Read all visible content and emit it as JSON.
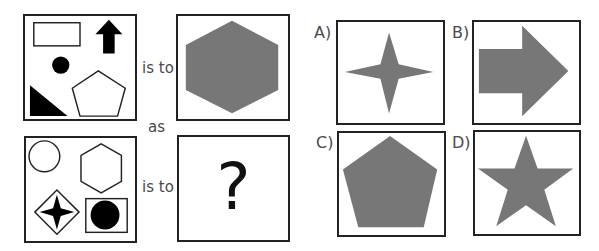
{
  "puzzle": {
    "connector_top": "is to",
    "connector_middle": "as",
    "connector_bottom": "is to",
    "unknown_symbol": "?"
  },
  "source_a": {
    "shapes": [
      "rectangle-outline",
      "arrow-up-filled",
      "circle-filled",
      "pentagon-outline",
      "right-triangle-filled"
    ]
  },
  "target_a": {
    "shape": "hexagon-filled-gray"
  },
  "source_b": {
    "shapes": [
      "circle-outline",
      "hexagon-outline",
      "four-point-star-in-diamond",
      "filled-circle-in-square"
    ]
  },
  "options": [
    {
      "label": "A)",
      "shape": "four-point-star"
    },
    {
      "label": "B)",
      "shape": "arrow-right"
    },
    {
      "label": "C)",
      "shape": "pentagon"
    },
    {
      "label": "D)",
      "shape": "five-point-star"
    }
  ],
  "colors": {
    "fill_gray": "#777777",
    "stroke": "#222222",
    "text": "#4a4a4a"
  }
}
